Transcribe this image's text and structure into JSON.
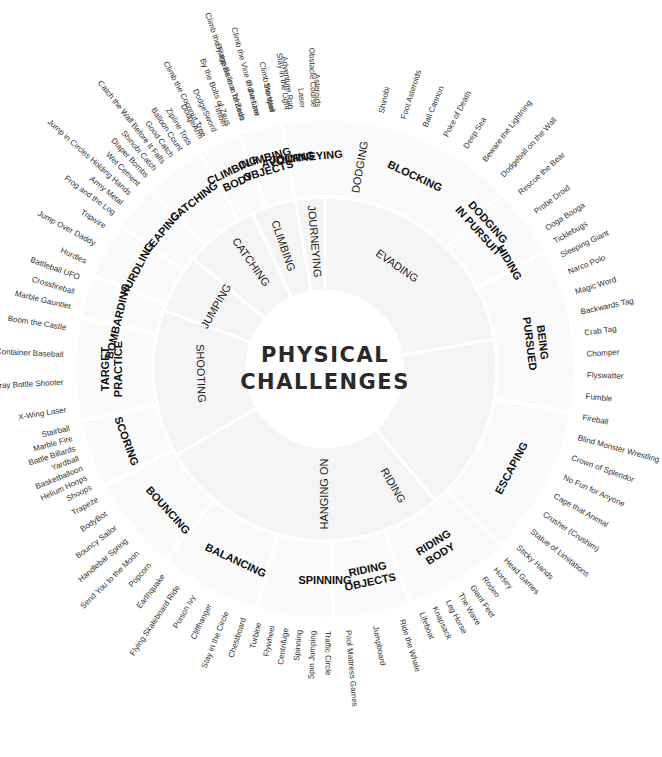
{
  "diagram": {
    "title_lines": [
      "PHYSICAL",
      "CHALLENGES"
    ],
    "colors": {
      "background": "#ffffff",
      "inner_ring": "#f5f5f5",
      "outer_ring": "#fafafa",
      "separator": "#ffffff",
      "text": "#222222",
      "leaf_text": "#333333"
    },
    "geometry": {
      "cx": 325,
      "cy": 369,
      "r_center": 78,
      "r_inner": 172,
      "r_outer": 250
    },
    "categories": [
      {
        "label": "EVADING",
        "angle": 35,
        "span": [
          -10,
          80
        ],
        "children": [
          {
            "label_lines": [
              "AVOIDING"
            ],
            "angle": -10,
            "span": [
              -30,
              0
            ],
            "leaves": [
              "DodgeArm",
              "DodgeSword",
              "By the Bolts of Zeus",
              "By the Balloon of Zeus",
              "Pulverizer",
              "Stomper",
              "Stay in the Light",
              "Laser",
              "Asteroids"
            ]
          },
          {
            "label_lines": [
              "BLOCKING"
            ],
            "angle": 25,
            "span": [
              10,
              40
            ],
            "leaves": [
              "Shinobi",
              "Foot Asteroids",
              "Ball Cannon",
              "Poke of Death",
              "Deep Sea",
              "Beware the Lightning"
            ]
          },
          {
            "label_lines": [
              "DODGING",
              "IN PURSUIT"
            ],
            "angle": 48,
            "span": [
              40,
              56
            ],
            "leaves": [
              "Dodgeball on the Wall",
              "Rescue the Bear",
              "Probe Droid"
            ]
          },
          {
            "label_lines": [
              "HIDING"
            ],
            "angle": 60,
            "span": [
              56,
              66
            ],
            "leaves": [
              "Ooga Booga",
              "Ticklebugs",
              "Sleeping Giant"
            ]
          },
          {
            "label_lines": [
              "BEING",
              "PURSUED"
            ],
            "angle": 83,
            "span": [
              66,
              103
            ],
            "leaves": [
              "Narco Polo",
              "Magic Word",
              "Backwards Tag",
              "Crab Tag",
              "Chomper",
              "Flyswatter",
              "Fumble",
              "Fireball"
            ]
          },
          {
            "label_lines": [
              "ESCAPING"
            ],
            "angle": 118,
            "span": [
              103,
              135
            ],
            "leaves": [
              "Blind Monster Wrestling",
              "Crown of Splendor",
              "No Fun for Anyone",
              "Cage that Animal",
              "Crusher (Crushim)",
              "Statue of Limitations",
              "Sticky Hands"
            ]
          }
        ],
        "dodging_label": "DODGING"
      },
      {
        "label": "RIDING",
        "angle": 150,
        "span": [
          135,
          175
        ],
        "children": [
          {
            "label_lines": [
              "RIDING",
              "BODY"
            ],
            "angle": 148,
            "span": [
              135,
              160
            ],
            "leaves": [
              "Head Games",
              "Horsey",
              "Rodeo",
              "Giant Feet",
              "The Wave",
              "Leg Horse",
              "Knapsack",
              "Lifeboat"
            ]
          },
          {
            "label_lines": [
              "RIDING",
              "OBJECTS"
            ],
            "angle": 168,
            "span": [
              160,
              178
            ],
            "leaves": [
              "Ride the Whale",
              "Jumpboard",
              "Pool Mattress Games"
            ]
          }
        ]
      },
      {
        "label": "HANGING ON",
        "angle": 180,
        "span": [
          140,
          240
        ],
        "children": [
          {
            "label_lines": [
              "SPINNING"
            ],
            "angle": 180,
            "span": [
              178,
              196
            ],
            "leaves": [
              "Traffic Circle",
              "Spin Jumping",
              "Spinning",
              "Centrifuge",
              "Flywheel",
              "Turbine"
            ]
          },
          {
            "label_lines": [
              "BALANCING"
            ],
            "angle": 205,
            "span": [
              196,
              220
            ],
            "leaves": [
              "Chestboard",
              "Stay in the Circle",
              "Cliffhanger",
              "Poison Ivy",
              "Flying Skateboard Ride",
              "Earthquake"
            ]
          },
          {
            "label_lines": [
              "BOUNCING"
            ],
            "angle": 228,
            "span": [
              220,
              242
            ],
            "leaves": [
              "Popcorn",
              "Send You to the Moon",
              "Handlebar Spring",
              "Bouncy Sailor",
              "BodyBot",
              "Trapeze"
            ]
          }
        ]
      },
      {
        "label": "SHOOTING",
        "angle": 265,
        "span": [
          240,
          290
        ],
        "children": [
          {
            "label_lines": [
              "SCORING"
            ],
            "angle": 250,
            "span": [
              242,
              258
            ],
            "leaves": [
              "Shoops",
              "Helium Hoops",
              "Basketballoon",
              "Yardball",
              "Battle Billards",
              "Marble Fire",
              "Stairball"
            ]
          },
          {
            "label_lines": [
              "TARGET",
              "PRACTICE"
            ],
            "angle": 270,
            "span": [
              258,
              282
            ],
            "leaves": [
              "X-Wing Laser",
              "Spray Bottle Shooter",
              "Milk Container Baseball",
              "Boom the Castle"
            ]
          },
          {
            "label_lines": [
              "BOMBARDING"
            ],
            "angle": 283,
            "span": [
              282,
              292
            ],
            "leaves": [
              "Marble Gauntlet",
              "Crossfireball",
              "Battleball UFO"
            ]
          }
        ]
      },
      {
        "label": "JUMPING",
        "angle": 297,
        "span": [
          290,
          310
        ],
        "children": [
          {
            "label_lines": [
              "HURDLING"
            ],
            "angle": 298,
            "span": [
              292,
              305
            ],
            "leaves": [
              "Hurdles",
              "Jump Over Daddy",
              "Tripwire"
            ]
          },
          {
            "label_lines": [
              "LEAPING"
            ],
            "angle": 310,
            "span": [
              305,
              316
            ],
            "leaves": [
              "Frog and the Log",
              "Army Metal",
              "Jump in Circles Holding Hands",
              "Wet Cement"
            ]
          }
        ]
      },
      {
        "label": "CATCHING",
        "angle": 322,
        "span": [
          310,
          335
        ],
        "children": [
          {
            "label_lines": [
              "CATCHING"
            ],
            "angle": 322,
            "span": [
              316,
              330
            ],
            "leaves": [
              "Diaper Bombs",
              "Shinobi Catch",
              "Catch the Wall Before It Falls",
              "Good Catch",
              "Balloon Count",
              "Zipline Toss"
            ]
          }
        ]
      },
      {
        "label": "CLIMBING",
        "angle": 342,
        "span": [
          335,
          350
        ],
        "children": [
          {
            "label_lines": [
              "CLIMBING",
              "BODY"
            ],
            "angle": 335,
            "span": [
              330,
              340
            ],
            "leaves": [
              "Climb the Coconut Tree",
              "Timber"
            ]
          },
          {
            "label_lines": [
              "CLIMBING",
              "OBJECTS"
            ],
            "angle": 344,
            "span": [
              340,
              350
            ],
            "leaves": [
              "Climb the Flagpole in a Tornado",
              "Climb the Vine to the Line",
              "Climb the Wall"
            ]
          }
        ]
      },
      {
        "label": "JOURNEYING",
        "angle": 355,
        "span": [
          350,
          360
        ],
        "children": [
          {
            "label_lines": [
              "JOURNEYING"
            ],
            "angle": 355,
            "span": [
              350,
              360
            ],
            "leaves": [
              "Adventure Run",
              "Obstacle Course"
            ]
          }
        ]
      }
    ]
  }
}
